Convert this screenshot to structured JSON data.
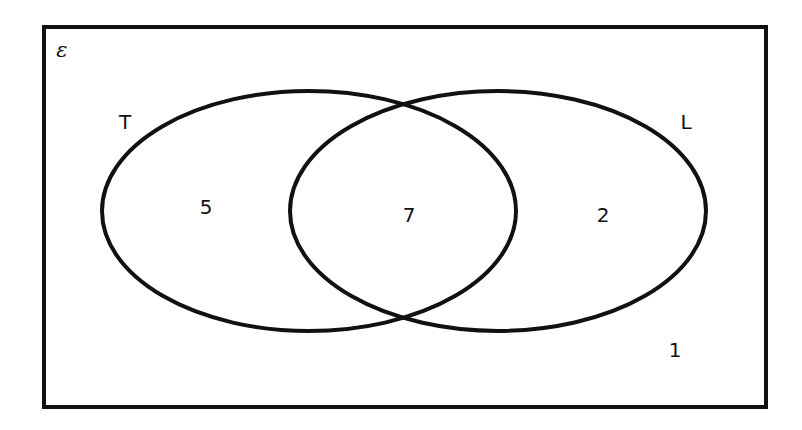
{
  "diagram": {
    "type": "venn",
    "universal_set": {
      "symbol": "ε"
    },
    "sets": [
      {
        "name": "T",
        "label": "T"
      },
      {
        "name": "L",
        "label": "L"
      }
    ],
    "regions": {
      "T_only": "5",
      "T_and_L": "7",
      "L_only": "2",
      "neither": "1"
    },
    "colors": {
      "stroke": "#111111",
      "background": "#ffffff"
    }
  }
}
